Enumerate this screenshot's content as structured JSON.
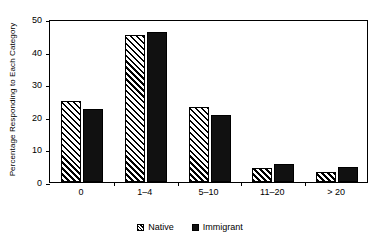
{
  "chart_data": {
    "type": "bar",
    "title": "",
    "subtitle": "",
    "xlabel": "",
    "ylabel": "Percentage Responding to Each Category",
    "categories": [
      "0",
      "1–4",
      "5–10",
      "11–20",
      "> 20"
    ],
    "series": [
      {
        "name": "Native",
        "values": [
          24.7,
          45.1,
          23.0,
          4.3,
          3.1
        ]
      },
      {
        "name": "Immigrant",
        "values": [
          22.4,
          46.0,
          20.6,
          5.5,
          4.6
        ]
      }
    ],
    "ylim": [
      0,
      50
    ],
    "yticks": [
      0,
      10,
      20,
      30,
      40,
      50
    ],
    "ytick_labels": [
      "0",
      "10",
      "20",
      "30",
      "40",
      "50"
    ],
    "grid": false,
    "legend_position": "bottom",
    "legend": [
      "Native",
      "Immigrant"
    ],
    "colors": {
      "native": "#ffffff",
      "native_hatch": "#000000",
      "immigrant": "#111111",
      "axis": "#000000",
      "background": "#ffffff"
    }
  }
}
